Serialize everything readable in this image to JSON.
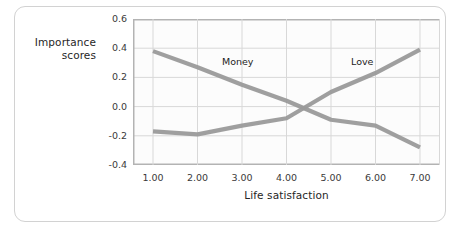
{
  "chart_data": {
    "type": "line",
    "title": "",
    "xlabel": "Life satisfaction",
    "ylabel": "Importance scores",
    "xlim": [
      0.55,
      7.45
    ],
    "ylim": [
      -0.4,
      0.6
    ],
    "grid": true,
    "legend_position": "inline-annotation",
    "xticks": [
      "1.00",
      "2.00",
      "3.00",
      "4.00",
      "5.00",
      "6.00",
      "7.00"
    ],
    "xtick_values": [
      1,
      2,
      3,
      4,
      5,
      6,
      7
    ],
    "yticks": [
      "0.6",
      "0.4",
      "0.2",
      "0.0",
      "-0.2",
      "-0.4"
    ],
    "ytick_values": [
      0.6,
      0.4,
      0.2,
      0.0,
      -0.2,
      -0.4
    ],
    "x": [
      1,
      2,
      3,
      4,
      5,
      6,
      7
    ],
    "series": [
      {
        "name": "Money",
        "color": "#9a9a9a",
        "values": [
          0.38,
          0.27,
          0.15,
          0.04,
          -0.09,
          -0.13,
          -0.28
        ],
        "annotation": "Money",
        "annotation_x": 2.55,
        "annotation_y": 0.3
      },
      {
        "name": "Love",
        "color": "#9a9a9a",
        "values": [
          -0.17,
          -0.19,
          -0.13,
          -0.08,
          0.1,
          0.23,
          0.39
        ],
        "annotation": "Love",
        "annotation_x": 5.45,
        "annotation_y": 0.3
      }
    ],
    "colors": {
      "line": "#9a9a9a",
      "grid": "#d8d8d8",
      "axis": "#b3b3b3",
      "frame": "#d2d2d2",
      "plot_background": "#fcfcfc",
      "text": "#262626"
    }
  }
}
